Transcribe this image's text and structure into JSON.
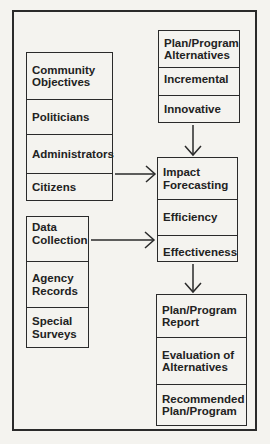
{
  "diagram": {
    "boxes": {
      "objectives": {
        "cells": [
          "Community Objectives",
          "Politicians",
          "Administrators",
          "Citizens"
        ]
      },
      "data": {
        "cells": [
          "Data Collection",
          "Agency Records",
          "Special Surveys"
        ]
      },
      "alternatives": {
        "cells": [
          "Plan/Program Alternatives",
          "Incremental",
          "Innovative"
        ]
      },
      "impact": {
        "cells": [
          "Impact Forecasting",
          "Efficiency",
          "Effectiveness"
        ]
      },
      "report": {
        "cells": [
          "Plan/Program Report",
          "Evaluation of Alternatives",
          "Recommended Plan/Program"
        ]
      }
    },
    "arrows": [
      {
        "from": "alternatives",
        "to": "impact",
        "direction": "down"
      },
      {
        "from": "objectives",
        "to": "impact",
        "direction": "right"
      },
      {
        "from": "data",
        "to": "impact",
        "direction": "right"
      },
      {
        "from": "impact",
        "to": "report",
        "direction": "down"
      }
    ],
    "colors": {
      "line": "#2a2a2a",
      "background": "#f4f3ef"
    }
  }
}
